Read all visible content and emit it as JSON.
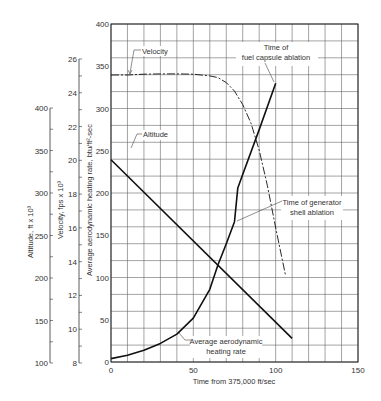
{
  "chart_data": {
    "type": "line",
    "title": "",
    "xlabel": "Time from 375,000 ft/sec",
    "x_ticks": [
      0,
      50,
      100,
      150
    ],
    "xlim": [
      0,
      150
    ],
    "axes": [
      {
        "id": "heating",
        "label": "Average aerodynamic heating rate, btu/ft²-sec",
        "ticks": [
          0,
          50,
          100,
          150,
          200,
          250,
          300,
          350,
          400
        ],
        "range": [
          0,
          400
        ]
      },
      {
        "id": "velocity",
        "label": "Velocity, fps x 10³",
        "ticks": [
          8,
          10,
          12,
          14,
          16,
          18,
          20,
          22,
          24,
          26
        ],
        "range": [
          8,
          26
        ]
      },
      {
        "id": "altitude",
        "label": "Altitude, ft x 10³",
        "ticks": [
          100,
          150,
          200,
          250,
          300,
          350,
          400
        ],
        "range": [
          100,
          400
        ]
      }
    ],
    "series": [
      {
        "name": "Velocity",
        "axis": "velocity",
        "style": "dashed",
        "x": [
          0,
          10,
          20,
          30,
          40,
          50,
          60,
          65,
          70,
          75,
          80,
          85,
          90,
          95,
          100,
          106
        ],
        "values": [
          25.05,
          25.05,
          25.1,
          25.12,
          25.12,
          25.1,
          25.0,
          24.9,
          24.6,
          24.1,
          23.3,
          22.2,
          20.6,
          18.5,
          16.0,
          13.2
        ]
      },
      {
        "name": "Altitude",
        "axis": "altitude",
        "style": "solid",
        "x": [
          0,
          110
        ],
        "values": [
          339,
          129
        ]
      },
      {
        "name": "Average aerodynamic heating rate",
        "axis": "heating",
        "style": "solid",
        "x": [
          0,
          10,
          20,
          30,
          40,
          50,
          60,
          65,
          70,
          75,
          77,
          80,
          90,
          100
        ],
        "values": [
          4,
          8,
          14,
          22,
          33,
          52,
          86,
          115,
          140,
          166,
          206,
          222,
          275,
          330
        ]
      }
    ],
    "annotations": [
      {
        "text": "Velocity",
        "points_to": [
          3,
          345
        ]
      },
      {
        "text": "Altitude",
        "points_to": [
          3,
          250
        ]
      },
      {
        "text": "Time of fuel capsule ablation",
        "points_to": [
          100,
          330
        ]
      },
      {
        "text": "Time of generator shell ablation",
        "points_to": [
          75,
          166
        ]
      },
      {
        "text": "Average aerodynamic heating rate",
        "points_to": [
          40,
          33
        ]
      }
    ],
    "grid": true,
    "grid_x_step": 10,
    "grid_y_step": 20
  },
  "labels": {
    "xlabel": "Time from 375,000 ft/sec",
    "heating_axis": "Average aerodynamic heating rate, btu/ft²-sec",
    "velocity_axis": "Velocity, fps x 10³",
    "altitude_axis": "Altitude, ft x 10³",
    "velocity_note": "Velocity",
    "altitude_note": "Altitude",
    "fuel_note_1": "Time of",
    "fuel_note_2": "fuel capsule ablation",
    "gen_note_1": "Time of generator",
    "gen_note_2": "shell ablation",
    "heat_note_1": "Average aerodynamic",
    "heat_note_2": "heating rate"
  }
}
